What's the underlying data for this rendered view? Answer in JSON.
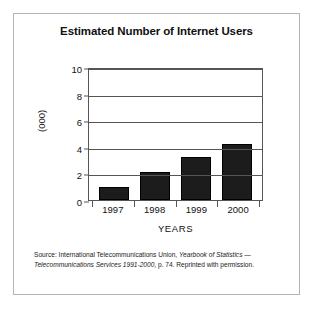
{
  "figure": {
    "title": "Estimated Number of Internet Users",
    "source_note": {
      "prefix": "Source: International Telecommunications Union, ",
      "italic_1": "Yearbook of Statistics",
      "middle": " — ",
      "italic_2": "Telecommunications Services 1991-2000",
      "suffix": ", p. 74. Reprinted with permission."
    },
    "border_color": "#b4b4b4"
  },
  "chart_data": {
    "type": "bar",
    "title": "Estimated Number of Internet Users",
    "categories": [
      "1997",
      "1998",
      "1999",
      "2000"
    ],
    "values": [
      1.0,
      2.1,
      3.2,
      4.2
    ],
    "xlabel": "YEARS",
    "ylabel": "(000)",
    "ylim": [
      0,
      10
    ],
    "yticks": [
      0,
      2,
      4,
      6,
      8,
      10
    ],
    "ytick_labels": [
      "0",
      "2",
      "4",
      "6",
      "8",
      "10"
    ],
    "grid": true,
    "legend": false,
    "bar_color": "#1c1c1c",
    "axis_color": "#555555"
  }
}
